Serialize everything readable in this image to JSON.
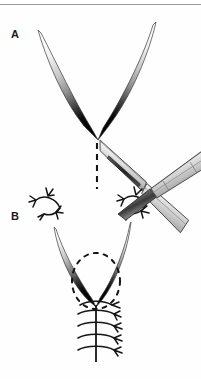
{
  "figure": {
    "type": "surgical-technique-illustration",
    "background_color": "#fefefe",
    "ink_color": "#1a1a1a",
    "width": 201,
    "height": 379,
    "panels": [
      {
        "id": "A",
        "label": "A",
        "label_x": 14,
        "label_y": 34,
        "caption_visible": false,
        "elements": [
          "v-shaped-wound-flap",
          "dashed-incision-line",
          "scalpel"
        ]
      },
      {
        "id": "B",
        "label": "B",
        "label_x": 14,
        "label_y": 216,
        "caption_visible": false,
        "elements": [
          "v-shaped-wound-flap",
          "dashed-oval-outline",
          "suture-line",
          "corner-sutures",
          "scalpel"
        ]
      }
    ]
  },
  "panel_a": {
    "label": "A",
    "wound": {
      "name": "v-shaped-wound-flap",
      "left_tip": [
        38,
        30
      ],
      "right_tip": [
        156,
        22
      ],
      "apex": [
        98,
        139
      ],
      "fill": "gradient-white-to-black"
    },
    "incision_line": {
      "name": "dashed-incision-line",
      "x": 97,
      "y_start": 141,
      "y_end": 188,
      "style": "dashed",
      "color": "#1a1a1a"
    },
    "scalpel": {
      "name": "scalpel",
      "tip": [
        100,
        140
      ],
      "blade_color": "#d9d9d9",
      "groove_color": "#303030",
      "handle_color": "#cccccc",
      "angle_deg": 33
    }
  },
  "panel_b": {
    "label": "B",
    "wound": {
      "name": "v-shaped-wound-flap",
      "left_tip": [
        54,
        227
      ],
      "right_tip": [
        131,
        222
      ],
      "apex": [
        96,
        306
      ],
      "fill": "gradient-white-to-black"
    },
    "dashed_outline": {
      "name": "dashed-oval-outline",
      "center": [
        96,
        281
      ],
      "rx": 24,
      "ry": 28,
      "style": "dashed"
    },
    "suture_line": {
      "name": "suture-line",
      "x": 96,
      "y_start": 306,
      "y_end": 360,
      "stitch_count": 5,
      "stitch_spacing": 11
    },
    "corner_sutures": [
      {
        "name": "corner-suture-left",
        "x": 50,
        "y": 205
      },
      {
        "name": "corner-suture-right",
        "x": 128,
        "y": 203
      }
    ],
    "scalpel": {
      "name": "scalpel",
      "tip": [
        120,
        215
      ],
      "blade_color": "#bfbfbf",
      "handle_color": "#c9c9c9"
    }
  },
  "artifacts": {
    "top_bleed_text": "",
    "bottom_bleed_text": "",
    "top_rule_visible": true
  }
}
